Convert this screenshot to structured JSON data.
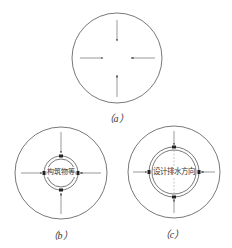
{
  "figure": {
    "colors": {
      "stroke": "#555555",
      "text": "#333333",
      "marker": "#222222"
    },
    "panels": [
      {
        "id": "a",
        "caption": "（a）",
        "outer_circle": {
          "cx": 117,
          "cy": 58,
          "r": 45
        },
        "inner_label": ""
      },
      {
        "id": "b",
        "caption": "（b）",
        "outer_circle": {
          "cx": 61,
          "cy": 173,
          "r": 46
        },
        "inner_rings": [
          17,
          14
        ],
        "inner_label": "构筑物等"
      },
      {
        "id": "c",
        "caption": "（c）",
        "outer_circle": {
          "cx": 174,
          "cy": 172,
          "r": 46
        },
        "inner_rings": [
          25,
          22
        ],
        "inner_label": "设计排水方向"
      }
    ]
  }
}
